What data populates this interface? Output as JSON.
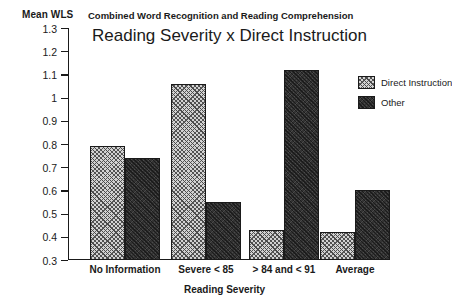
{
  "chart_data": {
    "type": "bar",
    "title": "Reading Severity x Direct Instruction",
    "subtitle": "Combined Word Recognition and Reading Comprehension",
    "xlabel": "Reading Severity",
    "ylabel": "Mean WLS",
    "ylim": [
      0.3,
      1.3
    ],
    "ytick_labels": [
      "1.3",
      "1.2",
      "1.1",
      "1",
      "0.9",
      "0.8",
      "0.7",
      "0.6",
      "0.5",
      "0.4",
      "0.3"
    ],
    "ytick_values": [
      1.3,
      1.2,
      1.1,
      1.0,
      0.9,
      0.8,
      0.7,
      0.6,
      0.5,
      0.4,
      0.3
    ],
    "grid": false,
    "legend_position": "top-right",
    "categories": [
      "No Information",
      "Severe < 85",
      "> 84 and < 91",
      "Average"
    ],
    "series": [
      {
        "name": "Direct Instruction",
        "values": [
          0.79,
          1.06,
          0.43,
          0.42
        ]
      },
      {
        "name": "Other",
        "values": [
          0.74,
          0.55,
          1.12,
          0.6
        ]
      }
    ]
  },
  "legend": {
    "items": [
      {
        "label": "Direct Instruction"
      },
      {
        "label": "Other"
      }
    ]
  }
}
